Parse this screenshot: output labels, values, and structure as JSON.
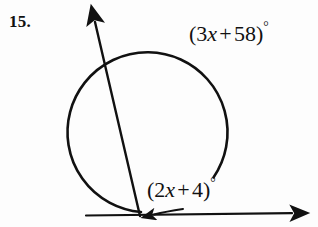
{
  "document": {
    "kind": "geometry-textbook-figure",
    "background_color": "#fdfdfd",
    "ink_color": "#111111",
    "width": 318,
    "height": 227
  },
  "problem": {
    "number_label": "15."
  },
  "labels": {
    "upper_arc": {
      "full_text": "(3x + 58)°",
      "open_paren": "(",
      "coefficient": "3",
      "variable": "x",
      "operator": "+",
      "constant": "58",
      "close_paren": ")",
      "degree_symbol": "°",
      "describes": "intercepted-arc-measure"
    },
    "lower_angle": {
      "full_text": "(2x + 4)°",
      "open_paren": "(",
      "coefficient": "2",
      "variable": "x",
      "operator": "+",
      "constant": "4",
      "close_paren": ")",
      "degree_symbol": "°",
      "describes": "angle-at-vertex-measure"
    }
  },
  "figure": {
    "circle": {
      "name": "circle-arc",
      "center_x": 142,
      "center_y": 132,
      "radius": 80,
      "gap_description": "open arc with break in lower-right",
      "stroke_width": 2.6
    },
    "secant": {
      "name": "secant-ray",
      "from_x": 140,
      "from_y": 216,
      "to_x": 95,
      "to_y": 22,
      "arrowhead": "at-upper-end",
      "stroke_width": 2.4
    },
    "horizontal_ray": {
      "name": "horizontal-ray",
      "from_x": 86,
      "from_y": 215,
      "to_x": 296,
      "to_y": 213,
      "arrowhead": "at-right-end",
      "stroke_width": 2.2
    },
    "angle_marker": {
      "name": "angle-arc-marker",
      "vertex_x": 140,
      "vertex_y": 216,
      "arrowhead": "at-left-end",
      "stroke_width": 2.0
    }
  }
}
